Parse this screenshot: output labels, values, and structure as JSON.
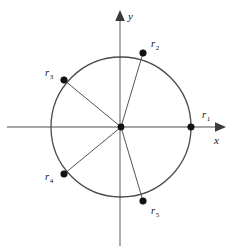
{
  "figure": {
    "background_color": "#ffffff",
    "axis_color": "#8a8a8a",
    "circle_color": "#4a4a4a",
    "radius_color": "#555555",
    "point_color": "#111111"
  },
  "axes": {
    "x_label": "x",
    "y_label": "y",
    "x_line": {
      "x1": 7,
      "y1": 127,
      "x2": 222,
      "y2": 127
    },
    "y_line": {
      "x1": 120,
      "y1": 246,
      "x2": 120,
      "y2": 14
    },
    "x_label_pos": {
      "x": 214,
      "y": 143
    },
    "y_label_pos": {
      "x": 128,
      "y": 19
    }
  },
  "circle": {
    "cx": 121,
    "cy": 127,
    "r": 70
  },
  "origin": {
    "x": 121,
    "y": 127,
    "dot_r": 3.4
  },
  "chart_data": {
    "type": "scatter",
    "xlabel": "x",
    "ylabel": "y",
    "grid": false,
    "legend": null,
    "xlim": [
      -1.55,
      1.45
    ],
    "ylim": [
      -1.7,
      1.6
    ],
    "unit_circle": {
      "center": [
        0,
        0
      ],
      "radius": 1
    },
    "points": [
      {
        "name": "r_1",
        "base": "r",
        "subscript": "1",
        "angle_deg": 0,
        "x": 1.0,
        "y": 0.0,
        "px": 191,
        "py": 127,
        "label_px": 202,
        "label_py": 118,
        "dot_r": 3.3,
        "has_radius_line": false
      },
      {
        "name": "r_2",
        "base": "r",
        "subscript": "2",
        "angle_deg": 72,
        "x": 0.309,
        "y": 0.951,
        "px": 143,
        "py": 53,
        "label_px": 151,
        "label_py": 47,
        "dot_r": 3.3,
        "has_radius_line": true
      },
      {
        "name": "r_3",
        "base": "r",
        "subscript": "3",
        "angle_deg": 144,
        "x": -0.809,
        "y": 0.588,
        "px": 64,
        "py": 80,
        "label_px": 45,
        "label_py": 76,
        "dot_r": 3.3,
        "has_radius_line": true
      },
      {
        "name": "r_4",
        "base": "r",
        "subscript": "4",
        "angle_deg": 216,
        "x": -0.809,
        "y": -0.588,
        "px": 64,
        "py": 174,
        "label_px": 45,
        "label_py": 180,
        "dot_r": 3.3,
        "has_radius_line": true
      },
      {
        "name": "r_5",
        "base": "r",
        "subscript": "5",
        "angle_deg": 288,
        "x": 0.309,
        "y": -0.951,
        "px": 143,
        "py": 201,
        "label_px": 151,
        "label_py": 214,
        "dot_r": 3.3,
        "has_radius_line": true
      }
    ]
  }
}
